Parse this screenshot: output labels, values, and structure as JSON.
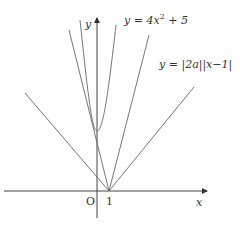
{
  "diagram": {
    "type": "function-graph",
    "axes": {
      "x_label": "x",
      "y_label": "y",
      "origin_label": "O",
      "tick_label_x": "1"
    },
    "curves": [
      {
        "name": "parabola",
        "label": "y = 4x² + 5",
        "label_parts": {
          "lhs": "y = 4x",
          "exp": "2",
          "rhs": " + 5"
        }
      },
      {
        "name": "absolute-value-lines",
        "label": "y = |2a||x−1|"
      }
    ],
    "colors": {
      "stroke": "#555555",
      "text": "#333333",
      "background": "#ffffff"
    }
  }
}
